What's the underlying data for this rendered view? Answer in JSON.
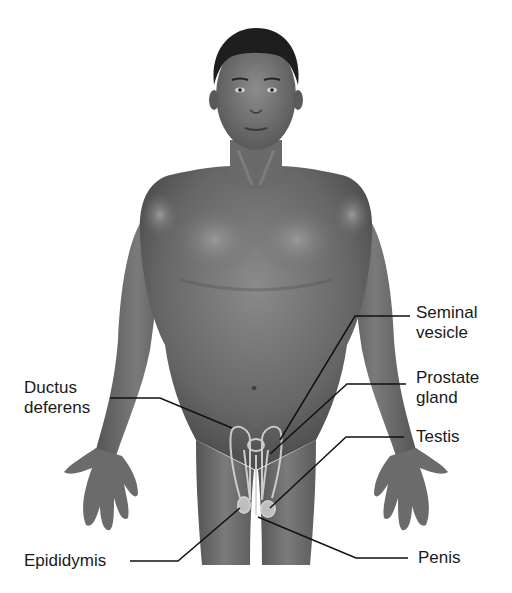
{
  "diagram": {
    "colors": {
      "background": "#ffffff",
      "skin_dark": "#4a4a4a",
      "skin_mid": "#6e6e6e",
      "skin_light": "#9a9a9a",
      "hair": "#1e1e1e",
      "organ_outline": "#d8d8d8",
      "leader_line": "#111111",
      "label_text": "#1a1a1a"
    },
    "labels": {
      "seminal_vesicle": "Seminal\nvesicle",
      "prostate_gland": "Prostate\ngland",
      "testis": "Testis",
      "ductus_deferens": "Ductus\ndeferens",
      "epididymis": "Epididymis",
      "penis": "Penis"
    }
  }
}
